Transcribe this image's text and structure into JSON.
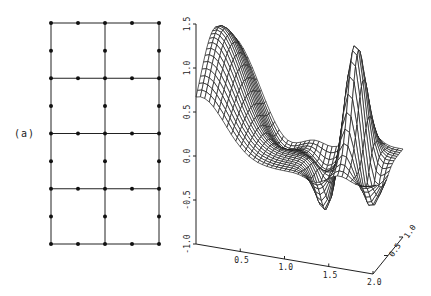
{
  "panel_label": "(a)",
  "mesh": {
    "description": "2 x 4 grid of 8-node quadrilateral elements",
    "columns": 2,
    "rows": 4,
    "origin": [
      51,
      23
    ],
    "width": 108,
    "height": 221,
    "line_color": "#222222",
    "node_color": "#111111"
  },
  "surface_plot": {
    "z_axis": {
      "ticks": [
        "1.5",
        "1.0",
        "0.5",
        "0.0",
        "-0.5",
        "-1.0"
      ],
      "values": [
        1.5,
        1.0,
        0.5,
        0.0,
        -0.5,
        -1.0
      ]
    },
    "x_axis": {
      "ticks": [
        "0.5",
        "1.0",
        "1.5",
        "2.0"
      ],
      "values": [
        0.5,
        1.0,
        1.5,
        2.0
      ],
      "range": [
        0,
        2
      ]
    },
    "y_axis": {
      "ticks": [
        "0.5",
        "1.0"
      ],
      "values": [
        0.5,
        1.0
      ],
      "range": [
        0,
        1
      ]
    },
    "zlim": [
      -1.0,
      1.5
    ],
    "grid_lines_x": 40,
    "grid_lines_y": 20,
    "line_color": "#1a1a1a"
  }
}
